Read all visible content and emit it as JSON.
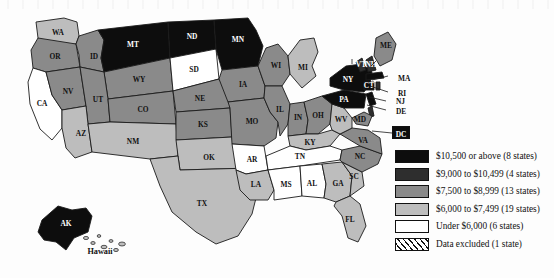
{
  "figure": {
    "type": "choropleth-map",
    "region": "United States",
    "background_color": "#fdfdfd"
  },
  "legend": {
    "name": "map-legend",
    "entries": [
      {
        "label": "$10,500 or above (8 states)",
        "color": "#0d0d0d",
        "pattern": "solid",
        "states": 8
      },
      {
        "label": "$9,000 to $10,499 (4 states)",
        "color": "#2e2e2e",
        "pattern": "solid",
        "states": 4
      },
      {
        "label": "$7,500 to $8,999 (13 states)",
        "color": "#8a8a8a",
        "pattern": "solid",
        "states": 13
      },
      {
        "label": "$6,000 to $7,499 (19 states)",
        "color": "#bdbdbd",
        "pattern": "solid",
        "states": 19
      },
      {
        "label": "Under $6,000 (6 states)",
        "color": "#ffffff",
        "pattern": "solid",
        "states": 6
      },
      {
        "label": "Data excluded (1 state)",
        "color": "#ffffff",
        "pattern": "hatched",
        "states": 1
      }
    ]
  },
  "chart_data": {
    "type": "heatmap",
    "title": "",
    "categories": [
      "$10,500 or above",
      "$9,000 to $10,499",
      "$7,500 to $8,999",
      "$6,000 to $7,499",
      "Under $6,000",
      "Data excluded"
    ],
    "values": [
      8,
      4,
      13,
      19,
      6,
      1
    ],
    "legend_position": "right",
    "grid": false,
    "states": [
      {
        "code": "WA",
        "label": "WA",
        "bin": 3
      },
      {
        "code": "OR",
        "label": "OR",
        "bin": 2
      },
      {
        "code": "CA",
        "label": "CA",
        "bin": 4
      },
      {
        "code": "NV",
        "label": "NV",
        "bin": 2
      },
      {
        "code": "ID",
        "label": "ID",
        "bin": 2
      },
      {
        "code": "MT",
        "label": "MT",
        "bin": 0
      },
      {
        "code": "WY",
        "label": "WY",
        "bin": 2
      },
      {
        "code": "UT",
        "label": "UT",
        "bin": 2
      },
      {
        "code": "AZ",
        "label": "AZ",
        "bin": 3
      },
      {
        "code": "CO",
        "label": "CO",
        "bin": 2
      },
      {
        "code": "NM",
        "label": "NM",
        "bin": 3
      },
      {
        "code": "ND",
        "label": "ND",
        "bin": 0
      },
      {
        "code": "SD",
        "label": "SD",
        "bin": 4
      },
      {
        "code": "NE",
        "label": "NE",
        "bin": 2
      },
      {
        "code": "KS",
        "label": "KS",
        "bin": 2
      },
      {
        "code": "OK",
        "label": "OK",
        "bin": 3
      },
      {
        "code": "TX",
        "label": "TX",
        "bin": 3
      },
      {
        "code": "MN",
        "label": "MN",
        "bin": 0
      },
      {
        "code": "IA",
        "label": "IA",
        "bin": 2
      },
      {
        "code": "MO",
        "label": "MO",
        "bin": 2
      },
      {
        "code": "AR",
        "label": "AR",
        "bin": 4
      },
      {
        "code": "LA",
        "label": "LA",
        "bin": 3
      },
      {
        "code": "WI",
        "label": "WI",
        "bin": 2
      },
      {
        "code": "IL",
        "label": "IL",
        "bin": 2
      },
      {
        "code": "MI",
        "label": "MI",
        "bin": 3
      },
      {
        "code": "IN",
        "label": "IN",
        "bin": 2
      },
      {
        "code": "OH",
        "label": "OH",
        "bin": 2
      },
      {
        "code": "KY",
        "label": "KY",
        "bin": 3
      },
      {
        "code": "TN",
        "label": "TN",
        "bin": 4
      },
      {
        "code": "MS",
        "label": "MS",
        "bin": 4
      },
      {
        "code": "AL",
        "label": "AL",
        "bin": 4
      },
      {
        "code": "GA",
        "label": "GA",
        "bin": 3
      },
      {
        "code": "FL",
        "label": "FL",
        "bin": 3
      },
      {
        "code": "SC",
        "label": "SC",
        "bin": 3
      },
      {
        "code": "NC",
        "label": "NC",
        "bin": 2
      },
      {
        "code": "VA",
        "label": "VA",
        "bin": 2
      },
      {
        "code": "WV",
        "label": "WV",
        "bin": 3
      },
      {
        "code": "PA",
        "label": "PA",
        "bin": 0
      },
      {
        "code": "NY",
        "label": "NY",
        "bin": 0
      },
      {
        "code": "VT",
        "label": "VT",
        "bin": 1
      },
      {
        "code": "NH",
        "label": "NH",
        "bin": 1
      },
      {
        "code": "ME",
        "label": "ME",
        "bin": 2
      },
      {
        "code": "MA",
        "label": "MA",
        "bin": 0
      },
      {
        "code": "RI",
        "label": "RI",
        "bin": 1
      },
      {
        "code": "CT",
        "label": "CT",
        "bin": 0
      },
      {
        "code": "NJ",
        "label": "NJ",
        "bin": 0
      },
      {
        "code": "DE",
        "label": "DE",
        "bin": 1
      },
      {
        "code": "MD",
        "label": "MD",
        "bin": 2
      },
      {
        "code": "DC",
        "label": "DC",
        "bin": 0
      },
      {
        "code": "AK",
        "label": "AK",
        "bin": 0
      },
      {
        "code": "HI",
        "label": "Hawaii",
        "bin": 3
      }
    ]
  }
}
